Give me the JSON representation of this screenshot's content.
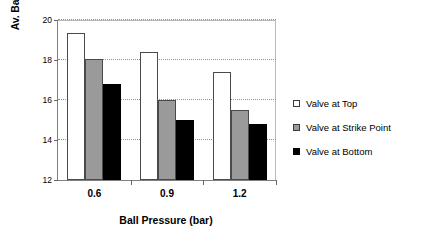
{
  "chart_data": {
    "type": "bar",
    "title": "",
    "xlabel": "Ball Pressure (bar)",
    "ylabel": "Av. Ball Launch Elevation (deg)",
    "categories": [
      "0.6",
      "0.9",
      "1.2"
    ],
    "ylim": [
      12,
      20
    ],
    "yticks": [
      12,
      14,
      16,
      18,
      20
    ],
    "ytick_labels": [
      "12",
      "14",
      "16",
      "18",
      "20"
    ],
    "grid": true,
    "legend_position": "right",
    "series": [
      {
        "name": "Valve at Top",
        "color": "#ffffff",
        "values": [
          19.35,
          18.4,
          17.4
        ]
      },
      {
        "name": "Valve at Strike Point",
        "color": "#9a9a9a",
        "values": [
          18.05,
          16.0,
          15.5
        ]
      },
      {
        "name": "Valve at Bottom",
        "color": "#000000",
        "values": [
          16.8,
          15.0,
          14.8
        ]
      }
    ]
  }
}
